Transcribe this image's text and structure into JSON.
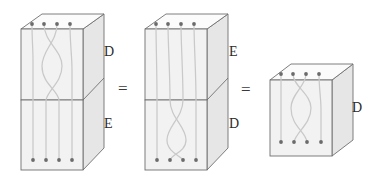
{
  "figure": {
    "background_color": "#ffffff",
    "line_color": "#6f6f6f",
    "face_fill_front": "#f2f2f2",
    "face_fill_top": "#fbfbfb",
    "face_fill_side": "#e4e4e4",
    "strand_color": "#c9c9c9",
    "dot_color": "#6b6b6b",
    "label_color": "#2b2b2b"
  },
  "relations": {
    "equals_1": "=",
    "equals_2": "="
  },
  "boxes": [
    {
      "id": "box-left",
      "kind": "stacked-pair",
      "compartments": [
        {
          "id": "box-left-top",
          "label": "D",
          "content": "braid"
        },
        {
          "id": "box-left-bottom",
          "label": "E",
          "content": "identity"
        }
      ],
      "top_dots": 4,
      "bottom_dots": 4
    },
    {
      "id": "box-middle",
      "kind": "stacked-pair",
      "compartments": [
        {
          "id": "box-middle-top",
          "label": "E",
          "content": "identity"
        },
        {
          "id": "box-middle-bottom",
          "label": "D",
          "content": "braid"
        }
      ],
      "top_dots": 4,
      "bottom_dots": 4
    },
    {
      "id": "box-right",
      "kind": "single",
      "compartments": [
        {
          "id": "box-right-only",
          "label": "D",
          "content": "braid"
        }
      ],
      "top_dots": 4,
      "bottom_dots": 4
    }
  ]
}
